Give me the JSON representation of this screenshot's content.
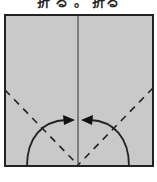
{
  "caption": {
    "text": "折 る 。 折る"
  },
  "diagram": {
    "paper_color": "#c9c9c9",
    "border_color": "#222222",
    "line_color": "#222222",
    "elements": [
      {
        "name": "paper-square"
      },
      {
        "name": "center-crease-line",
        "style": "solid"
      },
      {
        "name": "left-fold-line",
        "style": "dashed"
      },
      {
        "name": "right-fold-line",
        "style": "dashed"
      },
      {
        "name": "left-fold-arrow",
        "direction": "toward-center"
      },
      {
        "name": "right-fold-arrow",
        "direction": "toward-center"
      }
    ]
  }
}
